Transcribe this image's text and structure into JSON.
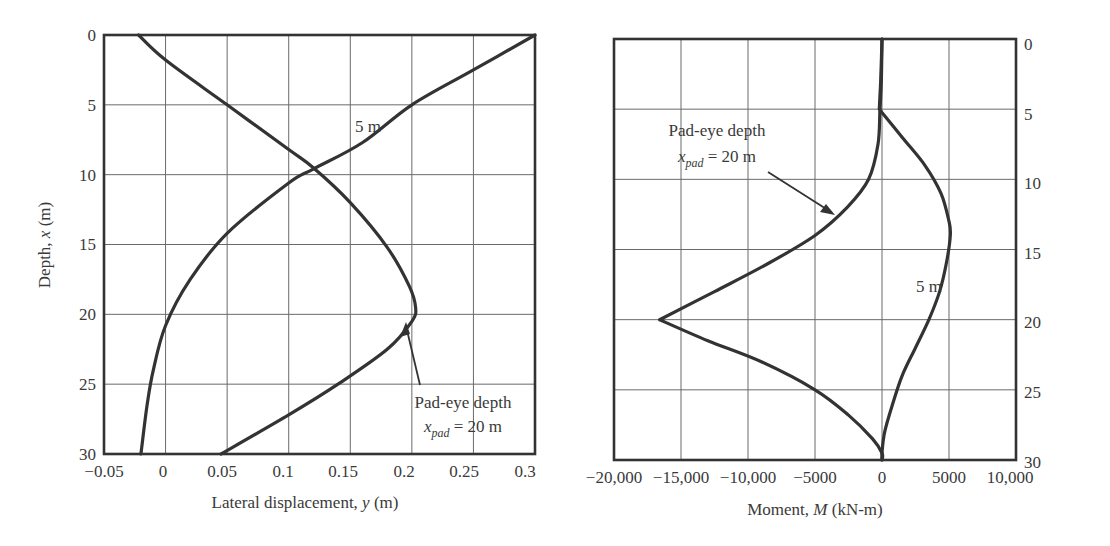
{
  "chart_data": [
    {
      "type": "line",
      "title": "",
      "xlabel": "Lateral displacement, y (m)",
      "xlabel_parts": {
        "pre": "Lateral displacement, ",
        "var": "y",
        "post": " (m)"
      },
      "ylabel": "Depth, x (m)",
      "ylabel_parts": {
        "pre": "Depth, ",
        "var": "x",
        "post": " (m)"
      },
      "xlim": [
        -0.05,
        0.3
      ],
      "ylim": [
        30,
        0
      ],
      "y_inverted": true,
      "grid": true,
      "xticks": [
        "−0.05",
        "0",
        "0.05",
        "0.1",
        "0.15",
        "0.2",
        "0.25",
        "0.3"
      ],
      "xtick_values": [
        -0.05,
        0,
        0.05,
        0.1,
        0.15,
        0.2,
        0.25,
        0.3
      ],
      "yticks": [
        "0",
        "5",
        "10",
        "15",
        "20",
        "25",
        "30"
      ],
      "ytick_values": [
        0,
        5,
        10,
        15,
        20,
        25,
        30
      ],
      "series": [
        {
          "name": "Pad-eye depth x_pad = 20 m",
          "points": [
            [
              -0.022,
              0
            ],
            [
              0.0,
              1.8
            ],
            [
              0.05,
              5.0
            ],
            [
              0.1,
              8.2
            ],
            [
              0.12,
              9.5
            ],
            [
              0.15,
              12.0
            ],
            [
              0.18,
              15.2
            ],
            [
              0.198,
              18.0
            ],
            [
              0.203,
              19.5
            ],
            [
              0.2,
              20.5
            ],
            [
              0.18,
              22.5
            ],
            [
              0.14,
              25.0
            ],
            [
              0.1,
              27.2
            ],
            [
              0.045,
              30
            ]
          ]
        },
        {
          "name": "5 m",
          "points": [
            [
              0.3,
              0
            ],
            [
              0.25,
              2.5
            ],
            [
              0.2,
              5.0
            ],
            [
              0.16,
              7.7
            ],
            [
              0.12,
              9.6
            ],
            [
              0.1,
              10.6
            ],
            [
              0.05,
              14.2
            ],
            [
              0.02,
              17.5
            ],
            [
              0.0,
              20.8
            ],
            [
              -0.01,
              24.0
            ],
            [
              -0.015,
              26.5
            ],
            [
              -0.02,
              30
            ]
          ]
        }
      ],
      "annotations": [
        {
          "text": "5 m",
          "x": 0.175,
          "y": 7.2
        },
        {
          "text": "Pad-eye depth",
          "x": 0.23,
          "y": 26.5,
          "arrow_to": [
            0.2,
            20.0
          ]
        },
        {
          "text": "x_pad = 20 m",
          "x": 0.23,
          "y": 28.5
        }
      ]
    },
    {
      "type": "line",
      "title": "",
      "xlabel": "Moment, M (kN-m)",
      "xlabel_parts": {
        "pre": "Moment, ",
        "var": "M",
        "post": " (kN-m)"
      },
      "ylabel": "",
      "xlim": [
        -20000,
        10000
      ],
      "ylim": [
        30,
        0
      ],
      "y_inverted": true,
      "y_axis_side": "right",
      "grid": true,
      "xticks": [
        "−20,000",
        "−15,000",
        "−10,000",
        "−5000",
        "0",
        "5000",
        "10,000"
      ],
      "xtick_values": [
        -20000,
        -15000,
        -10000,
        -5000,
        0,
        5000,
        10000
      ],
      "yticks": [
        "0",
        "5",
        "10",
        "15",
        "20",
        "25",
        "30"
      ],
      "ytick_values": [
        0,
        5,
        10,
        15,
        20,
        25,
        30
      ],
      "series": [
        {
          "name": "Pad-eye depth x_pad = 20 m",
          "points": [
            [
              0,
              0
            ],
            [
              -50,
              3.0
            ],
            [
              -150,
              5.0
            ],
            [
              -300,
              7.5
            ],
            [
              -1000,
              10.0
            ],
            [
              -2600,
              12.0
            ],
            [
              -5000,
              14.0
            ],
            [
              -8500,
              16.0
            ],
            [
              -12500,
              18.0
            ],
            [
              -16600,
              20.0
            ],
            [
              -13000,
              21.5
            ],
            [
              -9000,
              23.0
            ],
            [
              -5000,
              25.0
            ],
            [
              -2500,
              26.8
            ],
            [
              -700,
              28.5
            ],
            [
              0,
              29.5
            ],
            [
              0,
              30
            ]
          ]
        },
        {
          "name": "5 m",
          "points": [
            [
              0,
              0
            ],
            [
              -100,
              3.0
            ],
            [
              -200,
              5.0
            ],
            [
              1500,
              7.0
            ],
            [
              3200,
              9.0
            ],
            [
              4400,
              11.0
            ],
            [
              5000,
              13.0
            ],
            [
              5100,
              14.0
            ],
            [
              4800,
              16.0
            ],
            [
              4300,
              18.0
            ],
            [
              3500,
              20.0
            ],
            [
              2500,
              22.0
            ],
            [
              1500,
              24.0
            ],
            [
              800,
              26.0
            ],
            [
              200,
              28.0
            ],
            [
              0,
              29.5
            ],
            [
              0,
              30
            ]
          ]
        }
      ],
      "annotations": [
        {
          "text": "Pad-eye depth",
          "x": -11800,
          "y": 6.3,
          "arrow_to": [
            -3600,
            12.7
          ]
        },
        {
          "text": "x_pad = 20 m",
          "x": -11800,
          "y": 8.2
        },
        {
          "text": "5 m",
          "x": 2500,
          "y": 17.5
        }
      ]
    }
  ],
  "labels": {
    "left": {
      "xticks": [
        "−0.05",
        "0",
        "0.05",
        "0.1",
        "0.15",
        "0.2",
        "0.25",
        "0.3"
      ],
      "yticks": [
        "0",
        "5",
        "10",
        "15",
        "20",
        "25",
        "30"
      ],
      "xlabel_pre": "Lateral displacement, ",
      "xlabel_var": "y",
      "xlabel_post": " (m)",
      "ylabel_pre": "Depth, ",
      "ylabel_var": "x",
      "ylabel_post": " (m)",
      "label_5m": "5 m",
      "pad_line1": "Pad-eye depth",
      "pad_var": "x",
      "pad_sub": "pad",
      "pad_eq": " = 20 m"
    },
    "right": {
      "xticks": [
        "−20,000",
        "−15,000",
        "−10,000",
        "−5000",
        "0",
        "5000",
        "10,000"
      ],
      "yticks": [
        "0",
        "5",
        "10",
        "15",
        "20",
        "25",
        "30"
      ],
      "xlabel_pre": "Moment, ",
      "xlabel_var": "M",
      "xlabel_post": " (kN-m)",
      "label_5m": "5 m",
      "pad_line1": "Pad-eye depth",
      "pad_var": "x",
      "pad_sub": "pad",
      "pad_eq": " = 20 m"
    }
  }
}
